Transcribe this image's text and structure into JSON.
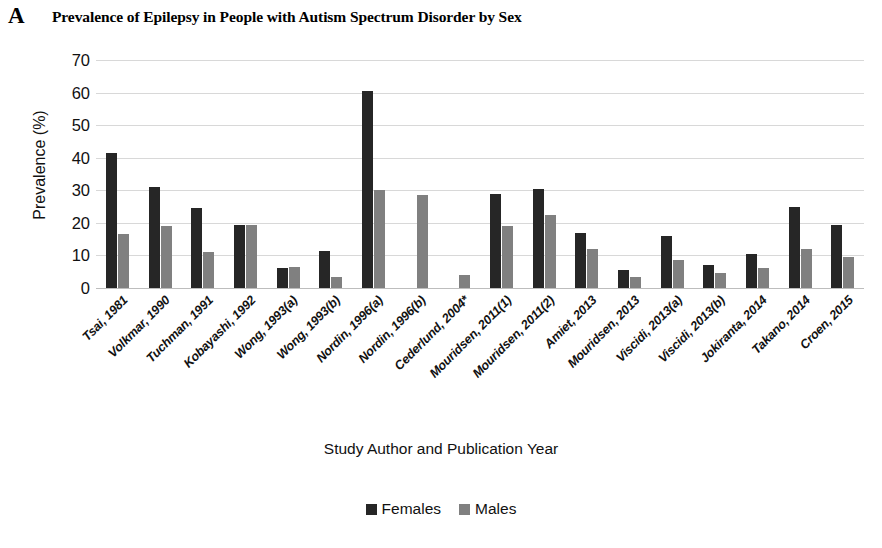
{
  "panel": {
    "letter": "A"
  },
  "chart_data": {
    "type": "bar",
    "title": "Prevalence of Epilepsy in People with Autism Spectrum Disorder by Sex",
    "xlabel": "Study Author and Publication Year",
    "ylabel": "Prevalence (%)",
    "ylim": [
      0,
      70
    ],
    "yticks": [
      70,
      60,
      50,
      40,
      30,
      20,
      10,
      0
    ],
    "grid": true,
    "legend_position": "bottom",
    "categories": [
      "Tsai, 1981",
      "Volkmar, 1990",
      "Tuchman, 1991",
      "Kobayashi, 1992",
      "Wong, 1993(a)",
      "Wong, 1993(b)",
      "Nordin, 1996(a)",
      "Nordin, 1996(b)",
      "Cederlund, 2004*",
      "Mouridsen, 2011(1)",
      "Mouridsen, 2011(2)",
      "Amiet, 2013",
      "Mouridsen, 2013",
      "Viscidi, 2013(a)",
      "Viscidi, 2013(b)",
      "Jokiranta, 2014",
      "Takano, 2014",
      "Croen, 2015"
    ],
    "series": [
      {
        "name": "Females",
        "color": "#262626",
        "values": [
          41.5,
          31,
          24.5,
          19.5,
          6,
          11.5,
          60.5,
          0,
          0,
          29,
          30.5,
          17,
          5.5,
          16,
          7,
          10.5,
          25,
          19.5
        ]
      },
      {
        "name": "Males",
        "color": "#808080",
        "values": [
          16.5,
          19,
          11,
          19.5,
          6.5,
          3.5,
          30,
          28.5,
          4,
          19,
          22.5,
          12,
          3.5,
          8.5,
          4.5,
          6,
          12,
          9.5
        ]
      }
    ]
  }
}
